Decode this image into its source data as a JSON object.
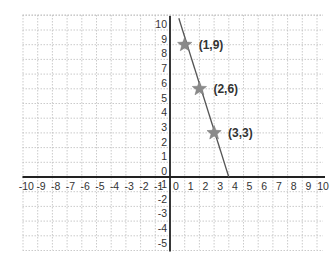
{
  "chart_data": {
    "type": "line",
    "title": "",
    "xlabel": "",
    "ylabel": "",
    "xlim": [
      -10,
      10
    ],
    "ylim": [
      -5,
      10
    ],
    "grid": true,
    "x_ticks": [
      "-10",
      "-9",
      "-8",
      "-7",
      "-6",
      "-5",
      "-4",
      "-3",
      "-2",
      "-1",
      "0",
      "1",
      "2",
      "3",
      "4",
      "5",
      "6",
      "7",
      "8",
      "9",
      "10"
    ],
    "y_ticks": [
      "10",
      "9",
      "8",
      "7",
      "6",
      "5",
      "4",
      "3",
      "2",
      "1",
      "0",
      "-1",
      "-2",
      "-3",
      "-4",
      "-5"
    ],
    "series": [
      {
        "name": "line",
        "equation": "y = -3x + 12",
        "x": [
          0.6,
          4
        ],
        "y": [
          10.8,
          0
        ]
      }
    ],
    "points": [
      {
        "x": 1,
        "y": 9,
        "label": "(1,9)",
        "marker": "star"
      },
      {
        "x": 2,
        "y": 6,
        "label": "(2,6)",
        "marker": "star"
      },
      {
        "x": 3,
        "y": 3,
        "label": "(3,3)",
        "marker": "star"
      }
    ],
    "colors": {
      "grid": "#bdbdbd",
      "axis": "#222222",
      "line": "#555555",
      "marker": "#8a8a8a",
      "text": "#333333"
    }
  }
}
